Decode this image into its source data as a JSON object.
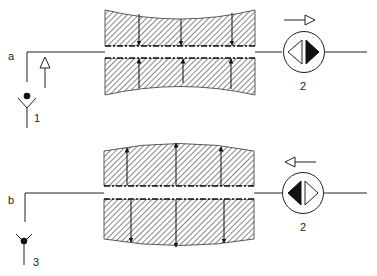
{
  "panels": [
    {
      "id": "a",
      "label": "a",
      "state": "contracting",
      "inlet_number": "1",
      "pump_number": "2",
      "flow_direction": "right",
      "wall_arrows": "inward"
    },
    {
      "id": "b",
      "label": "b",
      "state": "expanding",
      "inlet_number": "3",
      "pump_number": "2",
      "flow_direction": "left",
      "wall_arrows": "outward"
    }
  ],
  "colors": {
    "line": "#222222",
    "hatch": "#555555",
    "background": "#ffffff"
  }
}
